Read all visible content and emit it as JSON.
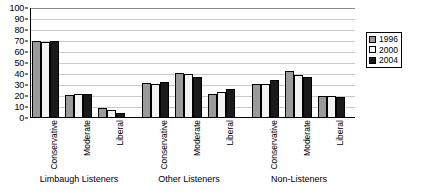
{
  "chart_data": {
    "type": "bar",
    "title": "",
    "xlabel": "",
    "ylabel": "",
    "ylim": [
      0,
      100
    ],
    "ytick_step": 10,
    "yticks": [
      "0",
      "10",
      "20",
      "30",
      "40",
      "50",
      "60",
      "70",
      "80",
      "90",
      "100"
    ],
    "grid": true,
    "legend_position": "right",
    "legend_entries": [
      "1996",
      "2000",
      "2004"
    ],
    "groups": [
      {
        "label": "Limbaugh Listeners",
        "categories": [
          "Conservative",
          "Moderate",
          "Liberal"
        ]
      },
      {
        "label": "Other Listeners",
        "categories": [
          "Conservative",
          "Moderate",
          "Liberal"
        ]
      },
      {
        "label": "Non-Listeners",
        "categories": [
          "Conservative",
          "Moderate",
          "Liberal"
        ]
      }
    ],
    "categories": [
      "Limbaugh Listeners - Conservative",
      "Limbaugh Listeners - Moderate",
      "Limbaugh Listeners - Liberal",
      "Other Listeners - Conservative",
      "Other Listeners - Moderate",
      "Other Listeners - Liberal",
      "Non-Listeners - Conservative",
      "Non-Listeners - Moderate",
      "Non-Listeners - Liberal"
    ],
    "series": [
      {
        "name": "1996",
        "color": "#9a9a9a",
        "values": [
          70,
          21,
          9,
          32,
          41,
          22,
          31,
          43,
          20
        ]
      },
      {
        "name": "2000",
        "color": "#f2f2f2",
        "values": [
          69,
          22,
          7,
          31,
          40,
          24,
          31,
          39,
          20
        ]
      },
      {
        "name": "2004",
        "color": "#1a1a1a",
        "values": [
          70,
          22,
          5,
          33,
          37,
          26,
          35,
          37,
          19
        ]
      }
    ]
  }
}
